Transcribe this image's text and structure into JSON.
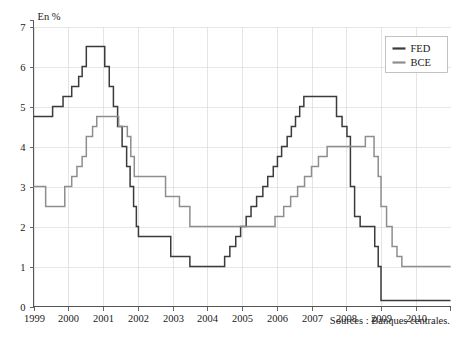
{
  "chart_data": {
    "type": "line",
    "title": "",
    "subtitle": "",
    "xlabel": "",
    "ylabel": "En %",
    "unit_label": "En %",
    "xlim": [
      1999,
      2011
    ],
    "ylim": [
      0,
      7
    ],
    "yticks": [
      "0",
      "1",
      "2",
      "3",
      "4",
      "5",
      "6",
      "7"
    ],
    "xticks": [
      "1999",
      "2000",
      "2001",
      "2002",
      "2003",
      "2004",
      "2005",
      "2006",
      "2007",
      "2008",
      "2009",
      "2010"
    ],
    "grid": true,
    "legend_position": "top-right",
    "step_style": "post",
    "series": [
      {
        "name": "FED",
        "color": "#3b3b3b",
        "points": [
          [
            1999.0,
            4.75
          ],
          [
            1999.5,
            4.75
          ],
          [
            1999.55,
            5.0
          ],
          [
            1999.8,
            5.0
          ],
          [
            1999.85,
            5.25
          ],
          [
            2000.05,
            5.25
          ],
          [
            2000.1,
            5.5
          ],
          [
            2000.25,
            5.5
          ],
          [
            2000.3,
            5.75
          ],
          [
            2000.35,
            5.75
          ],
          [
            2000.4,
            6.0
          ],
          [
            2000.48,
            6.0
          ],
          [
            2000.52,
            6.5
          ],
          [
            2001.0,
            6.5
          ],
          [
            2001.05,
            6.0
          ],
          [
            2001.12,
            6.0
          ],
          [
            2001.18,
            5.5
          ],
          [
            2001.25,
            5.5
          ],
          [
            2001.3,
            5.0
          ],
          [
            2001.38,
            5.0
          ],
          [
            2001.42,
            4.5
          ],
          [
            2001.5,
            4.5
          ],
          [
            2001.55,
            4.0
          ],
          [
            2001.62,
            4.0
          ],
          [
            2001.68,
            3.5
          ],
          [
            2001.72,
            3.5
          ],
          [
            2001.78,
            3.0
          ],
          [
            2001.82,
            3.0
          ],
          [
            2001.88,
            2.5
          ],
          [
            2001.92,
            2.5
          ],
          [
            2001.96,
            2.0
          ],
          [
            2002.0,
            2.0
          ],
          [
            2002.02,
            1.75
          ],
          [
            2002.9,
            1.75
          ],
          [
            2002.95,
            1.25
          ],
          [
            2003.45,
            1.25
          ],
          [
            2003.5,
            1.0
          ],
          [
            2004.45,
            1.0
          ],
          [
            2004.5,
            1.25
          ],
          [
            2004.6,
            1.25
          ],
          [
            2004.65,
            1.5
          ],
          [
            2004.78,
            1.5
          ],
          [
            2004.82,
            1.75
          ],
          [
            2004.92,
            1.75
          ],
          [
            2004.96,
            2.0
          ],
          [
            2005.08,
            2.0
          ],
          [
            2005.12,
            2.25
          ],
          [
            2005.22,
            2.25
          ],
          [
            2005.26,
            2.5
          ],
          [
            2005.38,
            2.5
          ],
          [
            2005.42,
            2.75
          ],
          [
            2005.55,
            2.75
          ],
          [
            2005.6,
            3.0
          ],
          [
            2005.7,
            3.0
          ],
          [
            2005.74,
            3.25
          ],
          [
            2005.86,
            3.25
          ],
          [
            2005.9,
            3.5
          ],
          [
            2005.98,
            3.5
          ],
          [
            2006.02,
            3.75
          ],
          [
            2006.1,
            3.75
          ],
          [
            2006.14,
            4.0
          ],
          [
            2006.26,
            4.0
          ],
          [
            2006.3,
            4.25
          ],
          [
            2006.38,
            4.25
          ],
          [
            2006.42,
            4.5
          ],
          [
            2006.5,
            4.5
          ],
          [
            2006.54,
            4.75
          ],
          [
            2006.62,
            4.75
          ],
          [
            2006.66,
            5.0
          ],
          [
            2006.74,
            5.0
          ],
          [
            2006.78,
            5.25
          ],
          [
            2007.68,
            5.25
          ],
          [
            2007.72,
            4.75
          ],
          [
            2007.85,
            4.75
          ],
          [
            2007.88,
            4.5
          ],
          [
            2007.98,
            4.5
          ],
          [
            2008.02,
            4.25
          ],
          [
            2008.08,
            4.25
          ],
          [
            2008.12,
            3.0
          ],
          [
            2008.2,
            3.0
          ],
          [
            2008.24,
            2.25
          ],
          [
            2008.35,
            2.25
          ],
          [
            2008.4,
            2.0
          ],
          [
            2008.78,
            2.0
          ],
          [
            2008.82,
            1.5
          ],
          [
            2008.88,
            1.5
          ],
          [
            2008.92,
            1.0
          ],
          [
            2008.96,
            1.0
          ],
          [
            2009.0,
            0.15
          ],
          [
            2011.0,
            0.15
          ]
        ]
      },
      {
        "name": "BCE",
        "color": "#8e8e8e",
        "points": [
          [
            1999.0,
            3.0
          ],
          [
            1999.3,
            3.0
          ],
          [
            1999.35,
            2.5
          ],
          [
            1999.85,
            2.5
          ],
          [
            1999.9,
            3.0
          ],
          [
            2000.05,
            3.0
          ],
          [
            2000.1,
            3.25
          ],
          [
            2000.2,
            3.25
          ],
          [
            2000.25,
            3.5
          ],
          [
            2000.35,
            3.5
          ],
          [
            2000.4,
            3.75
          ],
          [
            2000.48,
            3.75
          ],
          [
            2000.52,
            4.25
          ],
          [
            2000.65,
            4.25
          ],
          [
            2000.7,
            4.5
          ],
          [
            2000.78,
            4.5
          ],
          [
            2000.82,
            4.75
          ],
          [
            2001.4,
            4.75
          ],
          [
            2001.45,
            4.5
          ],
          [
            2001.65,
            4.5
          ],
          [
            2001.7,
            4.25
          ],
          [
            2001.76,
            4.25
          ],
          [
            2001.8,
            3.75
          ],
          [
            2001.86,
            3.75
          ],
          [
            2001.9,
            3.25
          ],
          [
            2002.75,
            3.25
          ],
          [
            2002.8,
            2.75
          ],
          [
            2003.15,
            2.75
          ],
          [
            2003.2,
            2.5
          ],
          [
            2003.45,
            2.5
          ],
          [
            2003.5,
            2.0
          ],
          [
            2005.9,
            2.0
          ],
          [
            2005.95,
            2.25
          ],
          [
            2006.15,
            2.25
          ],
          [
            2006.2,
            2.5
          ],
          [
            2006.35,
            2.5
          ],
          [
            2006.4,
            2.75
          ],
          [
            2006.55,
            2.75
          ],
          [
            2006.6,
            3.0
          ],
          [
            2006.75,
            3.0
          ],
          [
            2006.8,
            3.25
          ],
          [
            2006.95,
            3.25
          ],
          [
            2007.0,
            3.5
          ],
          [
            2007.15,
            3.5
          ],
          [
            2007.2,
            3.75
          ],
          [
            2007.4,
            3.75
          ],
          [
            2007.45,
            4.0
          ],
          [
            2008.5,
            4.0
          ],
          [
            2008.55,
            4.25
          ],
          [
            2008.75,
            4.25
          ],
          [
            2008.8,
            3.75
          ],
          [
            2008.88,
            3.75
          ],
          [
            2008.92,
            3.25
          ],
          [
            2008.96,
            3.25
          ],
          [
            2009.0,
            2.5
          ],
          [
            2009.12,
            2.5
          ],
          [
            2009.16,
            2.0
          ],
          [
            2009.28,
            2.0
          ],
          [
            2009.32,
            1.5
          ],
          [
            2009.42,
            1.5
          ],
          [
            2009.46,
            1.25
          ],
          [
            2009.56,
            1.25
          ],
          [
            2009.6,
            1.0
          ],
          [
            2011.0,
            1.0
          ]
        ]
      }
    ]
  },
  "legend": {
    "items": [
      {
        "label": "FED",
        "color": "#3b3b3b"
      },
      {
        "label": "BCE",
        "color": "#8e8e8e"
      }
    ]
  },
  "footer": {
    "source": "Sources : Banques centrales."
  },
  "colors": {
    "fed": "#3b3b3b",
    "bce": "#8e8e8e",
    "grid": "#dddddd",
    "axis": "#555555",
    "background": "#ffffff"
  }
}
